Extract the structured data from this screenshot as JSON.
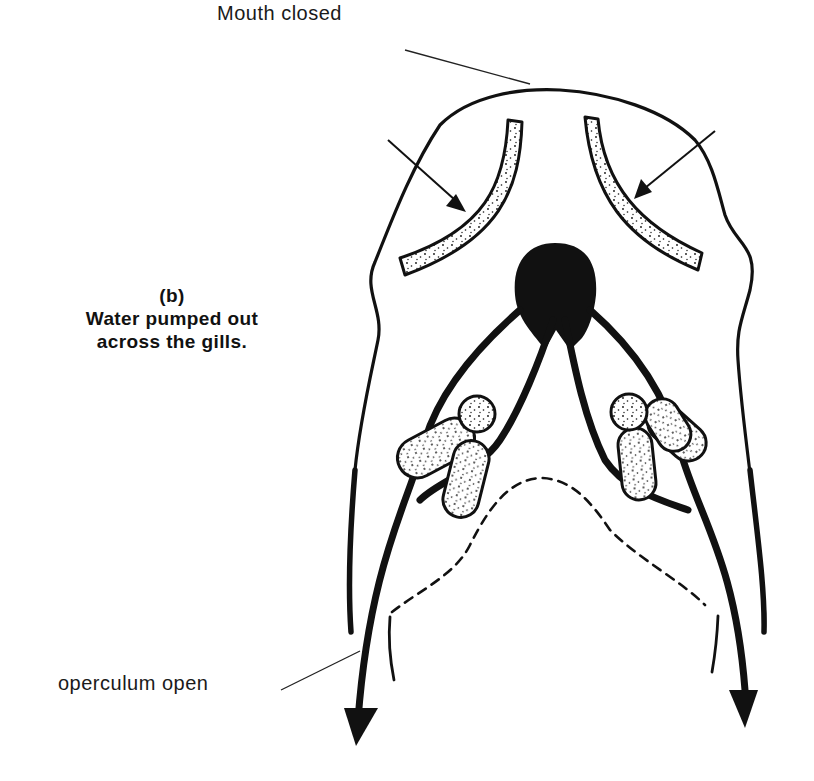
{
  "figure": {
    "panel_label": "(b)",
    "caption_lines": [
      "Water pumped out",
      "across the gills."
    ],
    "labels": {
      "mouth": "Mouth closed",
      "operculum": "operculum open"
    },
    "structures": [
      "head-outline",
      "gill-arch-left",
      "gill-arch-right",
      "inflow-arrow-left",
      "inflow-arrow-right",
      "buccal-mass",
      "water-flow-channel-left",
      "water-flow-channel-right",
      "gill-filaments-left",
      "gill-filaments-right",
      "pharynx-dashed-outline",
      "operculum-left",
      "operculum-right",
      "outflow-arrow-left",
      "outflow-arrow-right"
    ],
    "colors": {
      "ink": "#111111",
      "stipple_fill": "#f2f2f2",
      "background": "#ffffff"
    }
  }
}
